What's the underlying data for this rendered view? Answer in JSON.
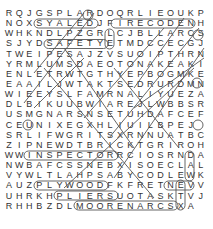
{
  "puzzle": {
    "type": "word-search",
    "rows": [
      "RQJGSPLARDOQRLIEOUKP",
      "NOXSYALEDJFIRECODENH",
      "WHKNDLPZGRLCJBLLARCS",
      "SJYDSAFETYETMDCCECGJ",
      "TWEIPESAJZVSUOIPTHRN",
      "YRMLUMSDAEOTONAKEAKI",
      "ENLETRWTGTHYEPBOGMKE",
      "EAAILJWTAKTSEDRURDMNM",
      "WIEEYSLFAMRNALIYUEZA",
      "DLBIKUUBWIAREJLWBBSR",
      "USMGNARSNSETUHDAFCEF",
      "CEUNIXEGXHLIUILBPEJ",
      "SRLIFWGRITSXRNNUATBC",
      "ZIPNEWDTBRICKTGRIROH",
      "WWINSPECTORRCIOSRNDA",
      "NWBAFCSSNEBXISOECLAL",
      "VYWLTLAHPSABYCODLEWK",
      "AUZPLYWOODFKFRETNEVV",
      "UHRKHPLIERSUOTASKTVJ",
      "RHHBZDLMOORENARCSXA"
    ],
    "found_words": [
      "SYALED",
      "FIRECODE",
      "SAFETY",
      "INSPECTOR",
      "PLYWOOD",
      "PLIERS",
      "MOORENARCS",
      "TASK",
      "BRICK",
      "SCAFFOLD"
    ]
  }
}
